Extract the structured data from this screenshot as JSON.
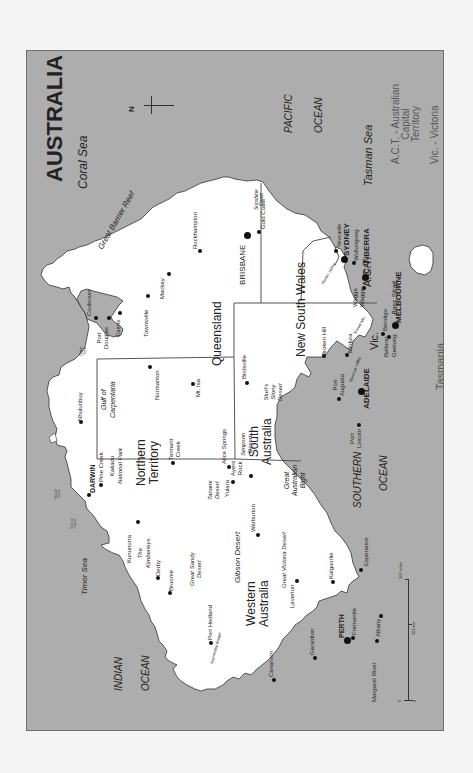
{
  "title": "AUSTRALIA",
  "compass": {
    "label": "N"
  },
  "colors": {
    "sea": "#adadad",
    "land": "#ffffff",
    "border": "#555555",
    "text": "#222222"
  },
  "legend": {
    "act": "A.C.T. - Australian\nCapital\nTerritory",
    "vic": "Vic.    - Victoria"
  },
  "scale": {
    "miles": "500 miles",
    "km": "500 km",
    "zero_left": "0",
    "zero_right": "0"
  },
  "water": {
    "coral_sea": "Coral Sea",
    "great_barrier_reef": "Great  Barrier  Reef",
    "pacific": "PACIFIC",
    "pacific_ocean": "OCEAN",
    "tasman_sea": "Tasman Sea",
    "indian": "INDIAN",
    "indian_ocean": "OCEAN",
    "timor_sea": "Timor Sea",
    "gulf": "Gulf of\nCarpentaria",
    "southern": "SOUTHERN",
    "southern_ocean": "OCEAN",
    "bight": "Great\nAustralian\nBight",
    "bass_strait": "Bass Strait"
  },
  "states": {
    "qld": "Queensland",
    "nsw": "New South Wales",
    "nt": "Northern\nTerritory",
    "sa": "South\nAustralia",
    "wa": "Western\nAustralia",
    "vic": "Vic.",
    "act": "A.C.T.",
    "tas": "Tasmania"
  },
  "features": {
    "cape_york": "Cape\nYork",
    "kakadu": "Kakadu\nNational Park",
    "melville": "Melville\nIsland",
    "bathurst": "Bathurst\nIsland",
    "kimberleys": "The\nKimberleys",
    "great_sandy": "Great Sandy\nDesert",
    "gibson": "Gibson Desert",
    "great_victoria": "Great  Victoria  Desert",
    "tanami": "Tanami\nDesert",
    "simpson": "Simpson\nDesert",
    "sturts": "Sturt's\nStony\nDesert",
    "hamersley": "Hamersley Range",
    "hunter": "Hunter Valley",
    "barossa": "Barossa Valley",
    "snowy": "Snowy Mts",
    "sunshine": "Sunshine\nCoast"
  },
  "cities": {
    "brisbane": "BRISBANE",
    "gold_coast": "Gold Coast",
    "rockhampton": "Rockhampton",
    "mackay": "Mackay",
    "townsville": "Townsville",
    "cairns": "Cairns",
    "port_douglas": "Port\nDouglas",
    "cooktown": "Cooktown",
    "normanton": "Normanton",
    "mt_isa": "Mt. Isa",
    "birdsville": "Birdsville",
    "newcastle": "Newcastle",
    "sydney": "SYDNEY",
    "wollongong": "Wollongong",
    "canberra": "CANBERRA",
    "wagga": "Wagga\nWagga",
    "broken_hill": "Broken Hill",
    "mildura": "Mildura",
    "bendigo": "Bendigo",
    "ballarat": "Ballarat",
    "geelong": "Geelong",
    "melbourne": "MELBOURNE",
    "hobart": "HOBART",
    "adelaide": "ADELAIDE",
    "port_augusta": "Port\nAugusta",
    "port_lincoln": "Port\nLincoln",
    "nhulunbuy": "Nhulunbuy",
    "darwin": "DARWIN",
    "pine_creek": "Pine Creek",
    "tennant_creek": "Tennant\nCreek",
    "alice_springs": "Alice Springs",
    "ayers_rock": "Ayers\nRock",
    "yulara": "Yulara",
    "kununurra": "Kununurra",
    "derby": "Derby",
    "broome": "Broome",
    "port_hedland": "Port Hedland",
    "warburton": "Warburton",
    "laverton": "Laverton",
    "kalgoorlie": "Kalgoorlie",
    "esperance": "Esperance",
    "albany": "Albany",
    "margaret_river": "Margaret River",
    "perth": "PERTH",
    "fremantle": "Fremantle",
    "geraldton": "Geraldton",
    "canarvon": "Canarvon"
  }
}
